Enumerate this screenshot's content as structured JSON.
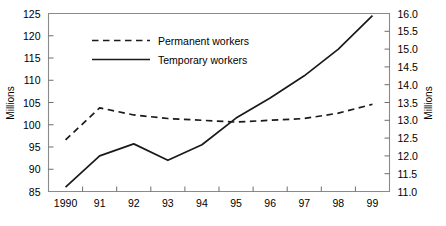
{
  "chart_data": {
    "type": "line",
    "title": "",
    "subtitle": "",
    "xlabel": "",
    "ylabel": "Millions",
    "y2label": "Millions",
    "grid": false,
    "legend_position": "top-center",
    "x": [
      "1990",
      "91",
      "92",
      "93",
      "94",
      "95",
      "96",
      "97",
      "98",
      "99"
    ],
    "xtick_labels": [
      "1990",
      "91",
      "92",
      "93",
      "94",
      "95",
      "96",
      "97",
      "98",
      "99"
    ],
    "ylim": [
      85,
      125
    ],
    "ytick_labels": [
      "85",
      "90",
      "95",
      "100",
      "105",
      "110",
      "115",
      "120",
      "125"
    ],
    "ytick_values": [
      85,
      90,
      95,
      100,
      105,
      110,
      115,
      120,
      125
    ],
    "y2lim": [
      11.0,
      16.0
    ],
    "y2tick_labels": [
      "11.0",
      "11.5",
      "12.0",
      "12.5",
      "13.0",
      "13.5",
      "14.0",
      "14.5",
      "15.0",
      "15.5",
      "16.0"
    ],
    "y2tick_values": [
      11.0,
      11.5,
      12.0,
      12.5,
      13.0,
      13.5,
      14.0,
      14.5,
      15.0,
      15.5,
      16.0
    ],
    "series": [
      {
        "name": "Permanent workers",
        "style": "dashed",
        "axis": "right",
        "color": "#1a1a1a",
        "values": [
          12.45,
          13.35,
          13.15,
          13.05,
          13.0,
          12.95,
          13.0,
          13.05,
          13.2,
          13.45
        ]
      },
      {
        "name": "Temporary workers",
        "style": "solid",
        "axis": "left",
        "color": "#1a1a1a",
        "values": [
          86.0,
          93.0,
          95.7,
          92.0,
          95.5,
          101.5,
          106.0,
          111.0,
          117.0,
          124.5
        ]
      }
    ]
  },
  "legend": {
    "items": [
      {
        "label": "Permanent workers",
        "style": "dashed"
      },
      {
        "label": "Temporary workers",
        "style": "solid"
      }
    ]
  },
  "axes": {
    "left_title": "Millions",
    "right_title": "Millions"
  }
}
